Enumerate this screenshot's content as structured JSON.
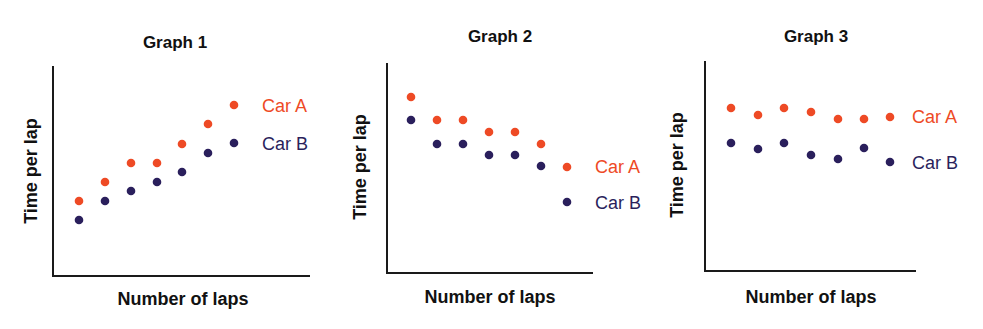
{
  "colors": {
    "car_a": "#ee4a25",
    "car_b": "#2a1f5c",
    "axis": "#1a1a1a",
    "text": "#111111"
  },
  "chart_data": [
    {
      "type": "scatter",
      "title": "Graph 1",
      "xlabel": "Number of laps",
      "ylabel": "Time per lap",
      "grid": false,
      "legend_position": "right, inline",
      "x": [
        1,
        2,
        3,
        4,
        5,
        6,
        7
      ],
      "series": [
        {
          "name": "Car A",
          "values": [
            3.6,
            4.5,
            5.4,
            5.4,
            6.3,
            7.2,
            8.2
          ]
        },
        {
          "name": "Car B",
          "values": [
            2.7,
            3.6,
            4.1,
            4.5,
            5.0,
            5.9,
            6.3
          ]
        }
      ],
      "ylim": [
        0,
        10
      ]
    },
    {
      "type": "scatter",
      "title": "Graph 2",
      "xlabel": "Number of laps",
      "ylabel": "Time per lap",
      "grid": false,
      "legend_position": "right, inline",
      "x": [
        1,
        2,
        3,
        4,
        5,
        6,
        7
      ],
      "series": [
        {
          "name": "Car A",
          "values": [
            8.4,
            7.3,
            7.3,
            6.7,
            6.7,
            6.2,
            5.1
          ]
        },
        {
          "name": "Car B",
          "values": [
            7.3,
            6.2,
            6.2,
            5.6,
            5.6,
            5.1,
            3.4
          ]
        }
      ],
      "ylim": [
        0,
        10
      ]
    },
    {
      "type": "scatter",
      "title": "Graph 3",
      "xlabel": "Number of laps",
      "ylabel": "Time per lap",
      "grid": false,
      "legend_position": "right, inline",
      "x": [
        1,
        2,
        3,
        4,
        5,
        6,
        7
      ],
      "series": [
        {
          "name": "Car A",
          "values": [
            7.8,
            7.5,
            7.8,
            7.6,
            7.3,
            7.3,
            7.4
          ]
        },
        {
          "name": "Car B",
          "values": [
            6.2,
            5.9,
            6.2,
            5.6,
            5.4,
            5.9,
            5.2
          ]
        }
      ],
      "ylim": [
        0,
        10
      ]
    }
  ],
  "layout": [
    {
      "axis_x0": 53,
      "axis_x1": 310,
      "axis_ytop": 66,
      "axis_ybottom": 276,
      "points_x": [
        79,
        105,
        131,
        157,
        182,
        208,
        234
      ],
      "a_y": [
        201,
        182,
        163,
        163,
        144,
        124,
        105
      ],
      "b_y": [
        220,
        201,
        191,
        182,
        172,
        153,
        143
      ],
      "legend_a": [
        262,
        112
      ],
      "legend_b": [
        262,
        150
      ],
      "title_pos": [
        175,
        48
      ],
      "xlabel_pos": [
        183,
        305
      ],
      "ylabel_pos": [
        37,
        171
      ]
    },
    {
      "axis_x0": 387,
      "axis_x1": 593,
      "axis_ytop": 63,
      "axis_ybottom": 273,
      "points_x": [
        411,
        437,
        463,
        489,
        515,
        541,
        567
      ],
      "a_y": [
        97,
        120,
        120,
        132,
        132,
        144,
        167
      ],
      "b_y": [
        120,
        144,
        144,
        155,
        155,
        166,
        202
      ],
      "legend_a": [
        595,
        173
      ],
      "legend_b": [
        595,
        209
      ],
      "title_pos": [
        500,
        42
      ],
      "xlabel_pos": [
        490,
        303
      ],
      "ylabel_pos": [
        366,
        167
      ]
    },
    {
      "axis_x0": 705,
      "axis_x1": 916,
      "axis_ytop": 61,
      "axis_ybottom": 271,
      "points_x": [
        731,
        758,
        784,
        811,
        838,
        864,
        890
      ],
      "a_y": [
        108,
        115,
        108,
        112,
        119,
        119,
        117
      ],
      "b_y": [
        143,
        149,
        143,
        155,
        159,
        148,
        162
      ],
      "legend_a": [
        912,
        123
      ],
      "legend_b": [
        912,
        169
      ],
      "title_pos": [
        816,
        42
      ],
      "xlabel_pos": [
        811,
        303
      ],
      "ylabel_pos": [
        683,
        165
      ]
    }
  ]
}
